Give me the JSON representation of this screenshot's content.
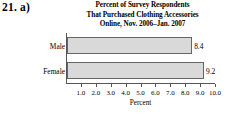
{
  "problem": {
    "label": "21. a)"
  },
  "chart_data": {
    "type": "bar",
    "orientation": "horizontal",
    "title": "Percent of Survey Respondents That Purchased Clothing Accessories Online, Nov. 2006–Jan. 2007",
    "title_lines": [
      "Percent of Survey Respondents",
      "That Purchased Clothing Accessories",
      "Online, Nov. 2006–Jan. 2007"
    ],
    "categories": [
      "Male",
      "Female"
    ],
    "values": [
      8.4,
      9.2
    ],
    "value_labels": [
      "8.4",
      "9.2"
    ],
    "xlabel": "Percent",
    "ylabel": "",
    "xlim": [
      0,
      10
    ],
    "xticks": [
      1.0,
      2.0,
      3.0,
      4.0,
      5.0,
      6.0,
      7.0,
      8.0,
      9.0,
      10.0
    ],
    "xtick_labels": [
      "1.0",
      "2.0",
      "3.0",
      "4.0",
      "5.0",
      "6.0",
      "7.0",
      "8.0",
      "9.0",
      "10.0"
    ],
    "grid": false,
    "legend": false,
    "bar_fill_color": "#d9d9d9",
    "bar_border_color": "#666666",
    "axis_color": "#555555"
  }
}
